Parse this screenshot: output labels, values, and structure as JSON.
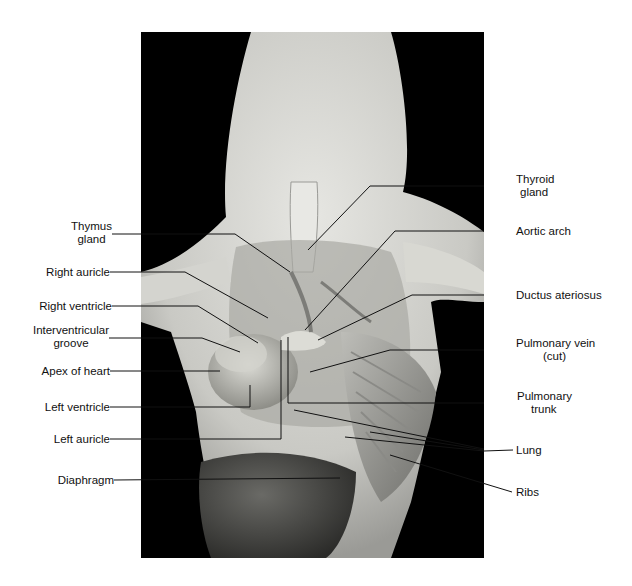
{
  "figure": {
    "background_color": "#000000",
    "label_color": "#111111"
  },
  "labels_left": [
    {
      "id": "thymus",
      "line1": "Thymus",
      "line2": "gland"
    },
    {
      "id": "right-auricle",
      "line1": "Right auricle",
      "line2": ""
    },
    {
      "id": "right-ventricle",
      "line1": "Right ventricle",
      "line2": ""
    },
    {
      "id": "interventricular-groove",
      "line1": "Interventricular",
      "line2": "groove"
    },
    {
      "id": "apex-of-heart",
      "line1": "Apex of heart",
      "line2": ""
    },
    {
      "id": "left-ventricle",
      "line1": "Left ventricle",
      "line2": ""
    },
    {
      "id": "left-auricle",
      "line1": "Left auricle",
      "line2": ""
    },
    {
      "id": "diaphragm",
      "line1": "Diaphragm",
      "line2": ""
    }
  ],
  "labels_right": [
    {
      "id": "thyroid",
      "line1": "Thyroid",
      "line2": "gland"
    },
    {
      "id": "aortic-arch",
      "line1": "Aortic arch",
      "line2": ""
    },
    {
      "id": "ductus",
      "line1": "Ductus ateriosus",
      "line2": ""
    },
    {
      "id": "pulmonary-vein",
      "line1": "Pulmonary vein",
      "line2": "(cut)"
    },
    {
      "id": "pulmonary-trunk",
      "line1": "Pulmonary",
      "line2": "trunk"
    },
    {
      "id": "lung",
      "line1": "Lung",
      "line2": ""
    },
    {
      "id": "ribs",
      "line1": "Ribs",
      "line2": ""
    }
  ]
}
